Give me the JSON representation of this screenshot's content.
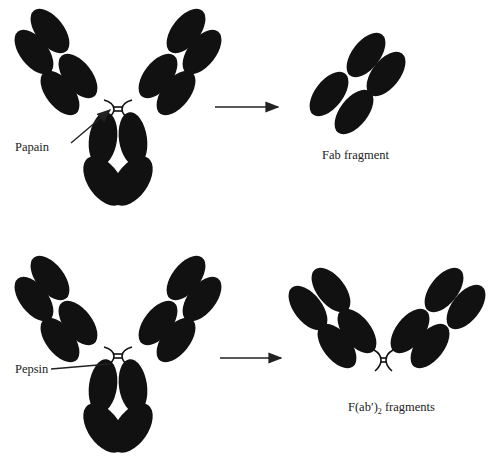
{
  "diagram": {
    "colors": {
      "domain": "#111111",
      "background": "#ffffff",
      "text": "#222222"
    },
    "rows": [
      {
        "id": "papain",
        "enzyme_label": "Papain",
        "product_label": "Fab fragment",
        "product_type": "single Fab arm (4 domains)"
      },
      {
        "id": "pepsin",
        "enzyme_label": "Pepsin",
        "product_label_main": "F(ab′)",
        "product_label_sub": "2",
        "product_label_tail": " fragments",
        "product_type": "two Fab arms joined at hinge"
      }
    ]
  }
}
